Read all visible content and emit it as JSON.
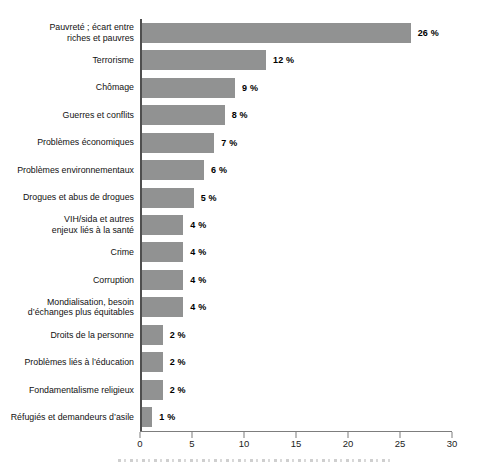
{
  "page": {
    "background": "#ffffff"
  },
  "chart_data": {
    "type": "bar",
    "orientation": "horizontal",
    "title": "",
    "xlabel": "",
    "ylabel": "",
    "grid": false,
    "bar_color": "#919292",
    "axis_color": "#4f4f4f",
    "xlim": [
      0,
      30
    ],
    "categories": [
      "Pauvreté ; écart entre\nriches et pauvres",
      "Terrorisme",
      "Chômage",
      "Guerres et conflits",
      "Problèmes économiques",
      "Problèmes environnementaux",
      "Drogues et abus de drogues",
      "VIH/sida et autres\nenjeux liés à la santé",
      "Crime",
      "Corruption",
      "Mondialisation, besoin\nd’échanges plus équitables",
      "Droits de la personne",
      "Problèmes liés à l’éducation",
      "Fondamentalisme religieux",
      "Réfugiés et demandeurs d’asile"
    ],
    "values": [
      26,
      12,
      9,
      8,
      7,
      6,
      5,
      4,
      4,
      4,
      4,
      2,
      2,
      2,
      1
    ],
    "value_labels": [
      "26 %",
      "12 %",
      "9 %",
      "8 %",
      "7 %",
      "6 %",
      "5 %",
      "4 %",
      "4 %",
      "4 %",
      "4 %",
      "2 %",
      "2 %",
      "2 %",
      "1 %"
    ],
    "xticks": [
      0,
      5,
      10,
      15,
      20,
      25,
      30
    ]
  }
}
